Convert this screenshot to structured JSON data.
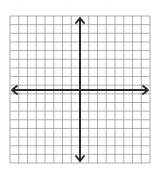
{
  "graph": {
    "type": "coordinate-plane",
    "grid": {
      "left": 10,
      "top": 16,
      "right": 150,
      "bottom": 163,
      "columns": 16,
      "rows": 17,
      "line_color": "#9a9a9a",
      "background": "#ffffff"
    },
    "axes": {
      "x_axis_y": 90,
      "y_axis_x": 80,
      "color": "#2a2a2a",
      "arrows": [
        "left",
        "right",
        "up",
        "down"
      ]
    },
    "labels": []
  },
  "top_fragment": {
    "marks": [
      "·",
      "·",
      "·"
    ]
  }
}
